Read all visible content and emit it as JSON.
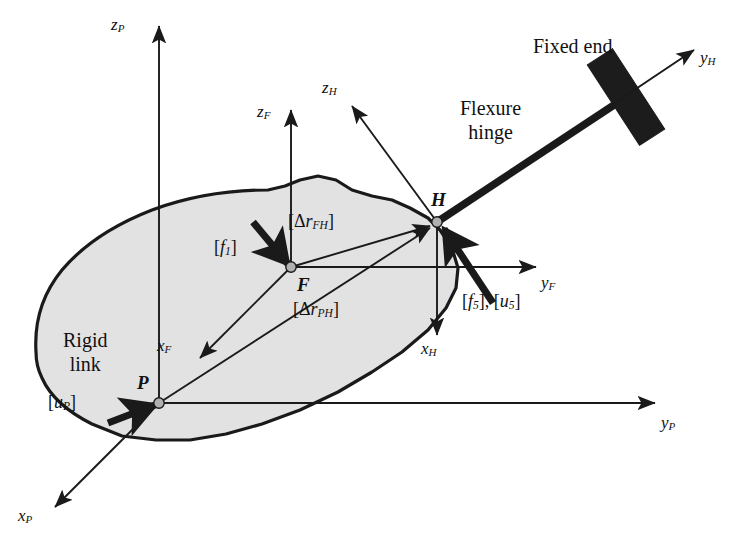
{
  "figure": {
    "type": "technical-diagram",
    "background_color": "#ffffff",
    "body_fill_color": "#e2e2e2",
    "line_color": "#1a1a1a",
    "fixed_end_color": "#1c1c1c",
    "node_fill_color": "#b0b0b0"
  },
  "labels": {
    "rigid_link_line1": "Rigid",
    "rigid_link_line2": "link",
    "flexure_hinge_line1": "Flexure",
    "flexure_hinge_line2": "hinge",
    "fixed_end": "Fixed end"
  },
  "points": [
    {
      "name": "P",
      "label": "P",
      "x": 159,
      "y": 403
    },
    {
      "name": "F",
      "label": "F",
      "x": 291,
      "y": 267
    },
    {
      "name": "H",
      "label": "H",
      "x": 437,
      "y": 222
    }
  ],
  "axes": [
    {
      "name": "z_P",
      "base": "z",
      "sub": "P",
      "frame": "P",
      "from": [
        159,
        403
      ],
      "to": [
        159,
        26
      ],
      "label_x": 111,
      "label_y": 16
    },
    {
      "name": "y_P",
      "base": "y",
      "sub": "P",
      "frame": "P",
      "from": [
        159,
        403
      ],
      "to": [
        655,
        403
      ],
      "label_x": 661,
      "label_y": 414
    },
    {
      "name": "x_P",
      "base": "x",
      "sub": "P",
      "frame": "P",
      "from": [
        159,
        403
      ],
      "to": [
        55,
        507
      ],
      "label_x": 18,
      "label_y": 507
    },
    {
      "name": "z_F",
      "base": "z",
      "sub": "F",
      "frame": "F",
      "from": [
        291,
        267
      ],
      "to": [
        291,
        110
      ],
      "label_x": 257,
      "label_y": 103
    },
    {
      "name": "y_F",
      "base": "y",
      "sub": "F",
      "frame": "F",
      "from": [
        291,
        267
      ],
      "to": [
        536,
        267
      ],
      "label_x": 541,
      "label_y": 274
    },
    {
      "name": "x_F",
      "base": "x",
      "sub": "F",
      "frame": "F",
      "from": [
        291,
        267
      ],
      "to": [
        200,
        358
      ],
      "label_x": 157,
      "label_y": 337
    },
    {
      "name": "z_H",
      "base": "z",
      "sub": "H",
      "frame": "H",
      "from": [
        437,
        222
      ],
      "to": [
        352,
        106
      ],
      "label_x": 322,
      "label_y": 79
    },
    {
      "name": "y_H",
      "base": "y",
      "sub": "H",
      "frame": "H",
      "from": [
        437,
        222
      ],
      "to": [
        694,
        50
      ],
      "label_x": 700,
      "label_y": 49
    },
    {
      "name": "x_H",
      "base": "x",
      "sub": "H",
      "frame": "H",
      "from": [
        437,
        222
      ],
      "to": [
        437,
        335
      ],
      "label_x": 421,
      "label_y": 340
    }
  ],
  "vectors": [
    {
      "name": "delta-r-FH",
      "prefix": "[Δ",
      "base": "r",
      "sub": "FH",
      "suffix": "]",
      "from": [
        291,
        267
      ],
      "to": [
        430,
        226
      ],
      "label_x": 288,
      "label_y": 212
    },
    {
      "name": "delta-r-PH",
      "prefix": "[Δ",
      "base": "r",
      "sub": "PH",
      "suffix": "]",
      "from": [
        159,
        403
      ],
      "to": [
        430,
        228
      ],
      "label_x": 293,
      "label_y": 300
    }
  ],
  "forces": [
    {
      "name": "f1-force-arrow",
      "prefix": "[",
      "base": "f",
      "sub": "1",
      "suffix": "]",
      "from": [
        253,
        222
      ],
      "to": [
        288,
        264
      ],
      "label_x": 214,
      "label_y": 238
    },
    {
      "name": "uP-displacement-arrow",
      "prefix": "[",
      "base": "u",
      "sub": "P",
      "suffix": "]",
      "from": [
        108,
        423
      ],
      "to": [
        155,
        405
      ],
      "label_x": 48,
      "label_y": 393
    },
    {
      "name": "f5-u5-force-arrow",
      "prefix": "[",
      "base": "f",
      "sub": "5",
      "suffix": "], [",
      "base2": "u",
      "sub2": "5",
      "suffix2": "]",
      "from": [
        493,
        303
      ],
      "to": [
        444,
        229
      ],
      "label_x": 462,
      "label_y": 292
    }
  ],
  "hinge": {
    "beam_from": [
      437,
      222
    ],
    "beam_to": [
      620,
      101
    ],
    "fixed_end_center": [
      626,
      97
    ],
    "fixed_end_angle_deg": -33,
    "fixed_end_width": 30,
    "fixed_end_height": 96
  },
  "annotation_positions": {
    "rigid_link_x": 63,
    "rigid_link_y": 328,
    "flexure_hinge_x": 460,
    "flexure_hinge_y": 96,
    "fixed_end_x": 533,
    "fixed_end_y": 36
  },
  "body_outline": "M 36,352 C 34,320 44,292 62,270 C 84,244 116,224 152,210 C 190,196 232,190 268,190 L 285,186 L 300,180 L 318,176 L 336,180 L 352,190 L 372,196 L 392,200 L 410,208 L 428,218 L 440,230 L 452,248 L 458,268 L 456,288 L 446,308 L 428,330 L 402,352 L 372,372 L 338,392 L 300,410 L 262,424 L 226,434 L 190,440 L 156,440 L 122,436 L 92,424 C 68,412 50,396 42,378 C 38,370 36,360 36,352 Z"
}
